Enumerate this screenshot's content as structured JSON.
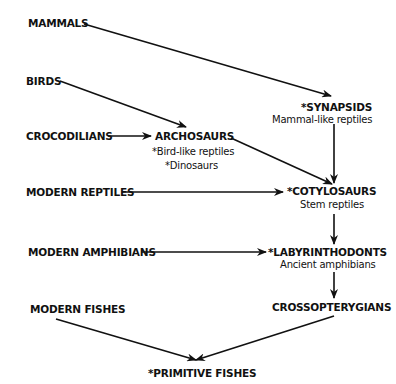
{
  "nodes": {
    "mammals": {
      "label": "MAMMALS"
    },
    "birds": {
      "label": "BIRDS"
    },
    "crocodilians": {
      "label": "CROCODILIANS"
    },
    "archosaurs": {
      "label": "ARCHOSAURS",
      "notes": [
        "*Bird-like reptiles",
        "*Dinosaurs"
      ]
    },
    "synapsids": {
      "label": "*SYNAPSIDS",
      "subtitle": "Mammal-like reptiles"
    },
    "modern_reptiles": {
      "label": "MODERN REPTILES"
    },
    "cotylosaurs": {
      "label": "*COTYLOSAURS",
      "subtitle": "Stem reptiles"
    },
    "modern_amphibians": {
      "label": "MODERN AMPHIBIANS"
    },
    "labyrinthodonts": {
      "label": "*LABYRINTHODONTS",
      "subtitle": "Ancient amphibians"
    },
    "modern_fishes": {
      "label": "MODERN FISHES"
    },
    "crossopterygians": {
      "label": "CROSSOPTERYGIANS"
    },
    "primitive_fishes": {
      "label": "*PRIMITIVE FISHES"
    }
  },
  "edges": [
    {
      "from": "synapsids",
      "to": "mammals"
    },
    {
      "from": "archosaurs",
      "to": "birds"
    },
    {
      "from": "archosaurs",
      "to": "crocodilians"
    },
    {
      "from": "cotylosaurs",
      "to": "archosaurs"
    },
    {
      "from": "cotylosaurs",
      "to": "synapsids"
    },
    {
      "from": "cotylosaurs",
      "to": "modern_reptiles"
    },
    {
      "from": "labyrinthodonts",
      "to": "cotylosaurs"
    },
    {
      "from": "labyrinthodonts",
      "to": "modern_amphibians"
    },
    {
      "from": "crossopterygians",
      "to": "labyrinthodonts"
    },
    {
      "from": "primitive_fishes",
      "to": "modern_fishes"
    },
    {
      "from": "primitive_fishes",
      "to": "crossopterygians"
    }
  ]
}
